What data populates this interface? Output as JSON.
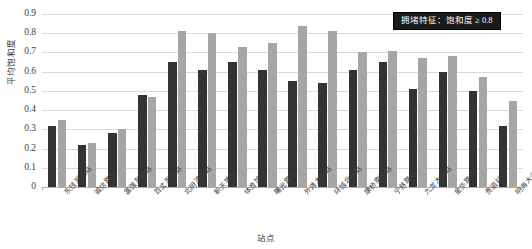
{
  "chart_data": {
    "type": "bar",
    "title": "",
    "xlabel": "站点",
    "ylabel": "平均饱和度",
    "ylim": [
      0,
      0.9
    ],
    "ytick_labels": [
      "0.9",
      "0.8",
      "0.7",
      "0.6",
      "0.5",
      "0.4",
      "0.3",
      "0.2",
      "0.1",
      "0"
    ],
    "ytick_values": [
      0.9,
      0.8,
      0.7,
      0.6,
      0.5,
      0.4,
      0.3,
      0.2,
      0.1,
      0
    ],
    "grid": true,
    "legend_position": "top-right",
    "categories": [
      "东钱湖北站",
      "诚信路站",
      "富强东路站",
      "百丈东路站",
      "北明泽路站",
      "新天地站",
      "体育馆站",
      "曙光路站",
      "外滩大桥站",
      "环城北路站",
      "康桥南路站",
      "宁慈路站",
      "九龙大道站",
      "金华路站",
      "贵驷站",
      "明海大道站"
    ],
    "series": [
      {
        "name": "series-dark",
        "color": "#333333",
        "values": [
          0.32,
          0.22,
          0.28,
          0.48,
          0.65,
          0.61,
          0.65,
          0.61,
          0.55,
          0.54,
          0.61,
          0.65,
          0.51,
          0.6,
          0.5,
          0.32
        ]
      },
      {
        "name": "series-light",
        "color": "#a6a6a6",
        "values": [
          0.35,
          0.23,
          0.3,
          0.47,
          0.81,
          0.8,
          0.73,
          0.75,
          0.84,
          0.81,
          0.7,
          0.71,
          0.67,
          0.68,
          0.57,
          0.45
        ]
      }
    ],
    "annotation": "拥堵特征：饱和度 ≥ 0.8"
  },
  "legend": {
    "text": "拥堵特征：饱和度 ≥ 0.8"
  },
  "axes": {
    "y_title": "平均饱和度",
    "x_title": "站点"
  }
}
